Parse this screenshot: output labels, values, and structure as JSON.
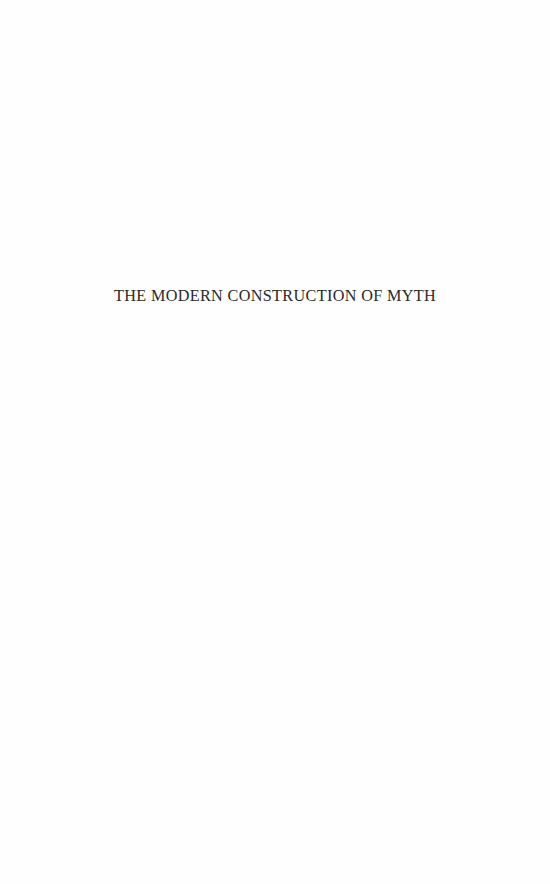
{
  "page": {
    "half_title": "THE MODERN CONSTRUCTION OF MYTH"
  }
}
